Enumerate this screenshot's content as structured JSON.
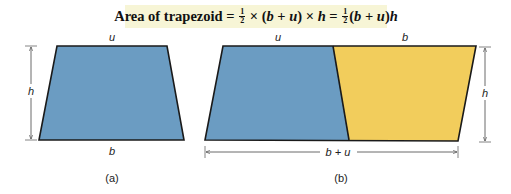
{
  "formula": {
    "prefix": "Area of trapezoid",
    "eq1": " = ",
    "half_num": "1",
    "half_den": "2",
    "times1": " × (",
    "b": "b",
    "plus": " + ",
    "u": "u",
    "close_times": ") × ",
    "h": "h",
    "eq2": " = ",
    "open": "(",
    "close": ")"
  },
  "figure_a": {
    "caption": "(a)",
    "top_label": "u",
    "bottom_label": "b",
    "height_label": "h",
    "fill": "#6b9cc2"
  },
  "figure_b": {
    "caption": "(b)",
    "top_left_label": "u",
    "top_right_label": "b",
    "height_label": "h",
    "base_label": "b + u",
    "left_fill": "#6b9cc2",
    "right_fill": "#f2cd5c"
  }
}
